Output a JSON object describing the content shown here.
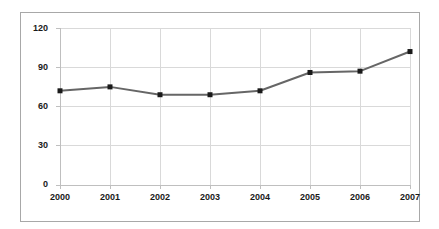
{
  "figure": {
    "background_color": "#ffffff",
    "frame_color": "#a8a8a8",
    "gridline_color": "#d9d9d9",
    "axis_color": "#bfbfbf"
  },
  "chart_data": {
    "type": "line",
    "title": "",
    "subtitle": "",
    "xlabel": "",
    "ylabel": "",
    "categories": [
      "2000",
      "2001",
      "2002",
      "2003",
      "2004",
      "2005",
      "2006",
      "2007"
    ],
    "x": [
      2000,
      2001,
      2002,
      2003,
      2004,
      2005,
      2006,
      2007
    ],
    "values": [
      72,
      75,
      69,
      69,
      72,
      86,
      87,
      102
    ],
    "series": [
      {
        "name": "",
        "values": [
          72,
          75,
          69,
          69,
          72,
          86,
          87,
          102
        ],
        "line_color": "#666666",
        "marker_color": "#1a1a1a",
        "marker": "square"
      }
    ],
    "ylim": [
      0,
      120
    ],
    "yticks": [
      0,
      30,
      60,
      90,
      120
    ],
    "ytick_labels": [
      "0",
      "30",
      "60",
      "90",
      "120"
    ],
    "xtick_labels": [
      "2000",
      "2001",
      "2002",
      "2003",
      "2004",
      "2005",
      "2006",
      "2007"
    ],
    "grid": true,
    "grid_axis": "both",
    "legend": false,
    "legend_position": "none",
    "annotations": []
  }
}
